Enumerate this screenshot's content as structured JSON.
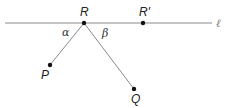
{
  "diagram": {
    "line_label": "ℓ",
    "points": {
      "R": {
        "label": "R",
        "x": 84,
        "y": 23
      },
      "R_prime": {
        "label": "R′",
        "x": 143,
        "y": 23
      },
      "P": {
        "label": "P",
        "x": 50,
        "y": 65
      },
      "Q": {
        "label": "Q",
        "x": 134,
        "y": 89
      }
    },
    "angles": {
      "alpha": "α",
      "beta": "β"
    },
    "colors": {
      "line": "#8a8a8a",
      "point": "#111111",
      "text": "#222222"
    }
  }
}
